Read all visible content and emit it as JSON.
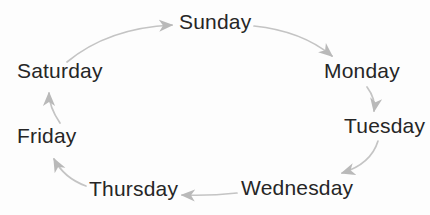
{
  "colors": {
    "background": "#fdfdfd",
    "text": "#262626",
    "arrow": "#c4c4c4",
    "arrowhead": "#b9b9b9"
  },
  "diagram": {
    "days": {
      "sunday": {
        "label": "Sunday"
      },
      "monday": {
        "label": "Monday"
      },
      "tuesday": {
        "label": "Tuesday"
      },
      "wednesday": {
        "label": "Wednesday"
      },
      "thursday": {
        "label": "Thursday"
      },
      "friday": {
        "label": "Friday"
      },
      "saturday": {
        "label": "Saturday"
      }
    },
    "arrows": [
      {
        "from": "Saturday",
        "to": "Sunday"
      },
      {
        "from": "Sunday",
        "to": "Monday"
      },
      {
        "from": "Monday",
        "to": "Tuesday"
      },
      {
        "from": "Tuesday",
        "to": "Wednesday"
      },
      {
        "from": "Wednesday",
        "to": "Thursday"
      },
      {
        "from": "Thursday",
        "to": "Friday"
      },
      {
        "from": "Friday",
        "to": "Saturday"
      }
    ]
  }
}
